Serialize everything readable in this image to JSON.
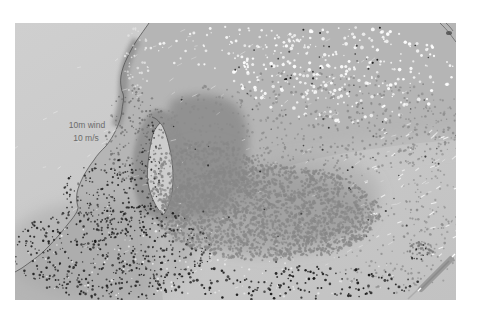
{
  "figure": {
    "kind": "meteorological map of coastal wind and dust field",
    "width_px": 479,
    "height_px": 314
  },
  "legend": {
    "line1": "10m wind",
    "line2": "10 m/s",
    "color": "#6b6b6b"
  },
  "palette": {
    "margin_white": "#ffffff",
    "ocean_light": "#cfcfcf",
    "ocean_shade": "#c2c2c2",
    "land": "#b5b5b5",
    "land_mottle": "#a6a6a6",
    "dark_region": "#8f8f8f",
    "gulf_water": "#cdcdcd",
    "coastline": "#4a4a4a",
    "dust_dot": "#878787",
    "black_dot": "#1c1c1c",
    "white_speck": "#ffffff"
  },
  "dot_fields": [
    {
      "name": "white-cloud-specks-ne",
      "type": "dot",
      "cx": 345,
      "cy": 75,
      "rx": 112,
      "ry": 48,
      "count": 300,
      "color": "#ffffff",
      "rmin": 0.7,
      "rmax": 1.9,
      "opacity": 0.95
    },
    {
      "name": "white-specks-top",
      "type": "dot",
      "cx": 235,
      "cy": 48,
      "rx": 85,
      "ry": 22,
      "count": 70,
      "color": "#ffffff",
      "rmin": 0.6,
      "rmax": 1.5,
      "opacity": 0.9
    },
    {
      "name": "white-streaks-right",
      "type": "streak",
      "cx": 415,
      "cy": 190,
      "rx": 55,
      "ry": 75,
      "count": 45,
      "color": "#ffffff",
      "lmin": 3,
      "lmax": 6,
      "w": 1.1,
      "angle": -28,
      "opacity": 0.85
    },
    {
      "name": "white-streaks-ocean",
      "type": "streak",
      "cx": 230,
      "cy": 160,
      "rx": 215,
      "ry": 135,
      "count": 110,
      "color": "#ffffff",
      "lmin": 3,
      "lmax": 6,
      "w": 1,
      "angle": -25,
      "opacity": 0.4
    },
    {
      "name": "white-specks-coast-band",
      "type": "dot",
      "cx": 137,
      "cy": 62,
      "rx": 13,
      "ry": 36,
      "count": 45,
      "color": "#e8e8e8",
      "rmin": 0.6,
      "rmax": 1.4,
      "opacity": 0.9
    },
    {
      "name": "white-specks-sw-land",
      "type": "dot",
      "cx": 110,
      "cy": 252,
      "rx": 92,
      "ry": 46,
      "count": 60,
      "color": "#ffffff",
      "rmin": 0.5,
      "rmax": 1.2,
      "opacity": 0.7
    },
    {
      "name": "white-specks-bottom",
      "type": "dot",
      "cx": 260,
      "cy": 275,
      "rx": 150,
      "ry": 22,
      "count": 55,
      "color": "#f2f2f2",
      "rmin": 0.5,
      "rmax": 1.2,
      "opacity": 0.8
    },
    {
      "name": "dust-band-upper",
      "type": "dot",
      "cx": 310,
      "cy": 125,
      "rx": 150,
      "ry": 55,
      "count": 520,
      "color": "#8a8a8a",
      "rmin": 0.7,
      "rmax": 1.4,
      "opacity": 0.9
    },
    {
      "name": "dust-cloud-core",
      "type": "dot",
      "cx": 268,
      "cy": 213,
      "rx": 112,
      "ry": 48,
      "count": 2000,
      "color": "#878787",
      "rmin": 0.8,
      "rmax": 1.7,
      "opacity": 0.92
    },
    {
      "name": "dust-cloud-west",
      "type": "dot",
      "cx": 205,
      "cy": 182,
      "rx": 55,
      "ry": 42,
      "count": 600,
      "color": "#878787",
      "rmin": 0.8,
      "rmax": 1.6,
      "opacity": 0.92
    },
    {
      "name": "dust-scatter-se",
      "type": "dot",
      "cx": 395,
      "cy": 245,
      "rx": 75,
      "ry": 48,
      "count": 170,
      "color": "#8a8a8a",
      "rmin": 0.7,
      "rmax": 1.3,
      "opacity": 0.85
    },
    {
      "name": "dust-clump-se",
      "type": "dot",
      "cx": 420,
      "cy": 249,
      "rx": 14,
      "ry": 8,
      "count": 40,
      "color": "#777777",
      "rmin": 0.7,
      "rmax": 1.4,
      "opacity": 0.9
    },
    {
      "name": "dust-scatter-right-edge",
      "type": "dot",
      "cx": 440,
      "cy": 170,
      "rx": 40,
      "ry": 80,
      "count": 120,
      "color": "#8d8d8d",
      "rmin": 0.6,
      "rmax": 1.2,
      "opacity": 0.8
    },
    {
      "name": "dust-specks-peninsula",
      "type": "dot",
      "cx": 135,
      "cy": 135,
      "rx": 30,
      "ry": 50,
      "count": 160,
      "color": "#6f6f6f",
      "rmin": 0.6,
      "rmax": 1.3,
      "opacity": 0.9
    },
    {
      "name": "black-specks-gulf-west-edge",
      "type": "dot",
      "cx": 150,
      "cy": 168,
      "rx": 10,
      "ry": 48,
      "count": 60,
      "color": "#262626",
      "rmin": 0.5,
      "rmax": 1.1,
      "opacity": 0.9
    },
    {
      "name": "black-specks-sw-land",
      "type": "dot",
      "cx": 112,
      "cy": 252,
      "rx": 100,
      "ry": 50,
      "count": 520,
      "color": "#1c1c1c",
      "rmin": 0.6,
      "rmax": 1.3,
      "opacity": 0.95
    },
    {
      "name": "black-specks-coast-mid",
      "type": "dot",
      "cx": 105,
      "cy": 195,
      "rx": 42,
      "ry": 38,
      "count": 150,
      "color": "#1c1c1c",
      "rmin": 0.6,
      "rmax": 1.2,
      "opacity": 0.9
    },
    {
      "name": "black-specks-bottom-strip",
      "type": "dot",
      "cx": 285,
      "cy": 283,
      "rx": 135,
      "ry": 17,
      "count": 160,
      "color": "#141414",
      "rmin": 0.7,
      "rmax": 1.5,
      "opacity": 0.95
    },
    {
      "name": "black-specks-scatter",
      "type": "dot",
      "cx": 300,
      "cy": 150,
      "rx": 160,
      "ry": 120,
      "count": 55,
      "color": "#202020",
      "rmin": 0.6,
      "rmax": 1.1,
      "opacity": 0.85
    },
    {
      "name": "black-specks-se-clump",
      "type": "dot",
      "cx": 418,
      "cy": 252,
      "rx": 12,
      "ry": 8,
      "count": 10,
      "color": "#1a1a1a",
      "rmin": 0.6,
      "rmax": 1.1,
      "opacity": 0.95
    },
    {
      "name": "black-specks-top",
      "type": "dot",
      "cx": 330,
      "cy": 55,
      "rx": 120,
      "ry": 30,
      "count": 22,
      "color": "#111111",
      "rmin": 0.7,
      "rmax": 1.2,
      "opacity": 0.95
    }
  ]
}
